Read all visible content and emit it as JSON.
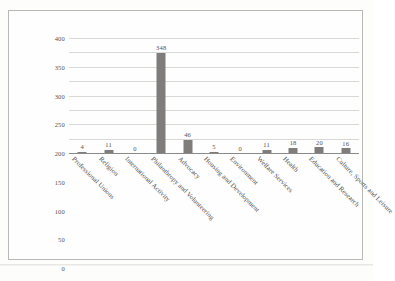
{
  "figure": {
    "caption_remnant": ""
  },
  "chart_data": {
    "type": "bar",
    "title": "",
    "xlabel": "",
    "ylabel": "",
    "ylim": [
      0,
      400
    ],
    "ytick_step": 50,
    "grid": true,
    "legend": "none",
    "bar_color": "#7e7d7b",
    "categories": [
      "Professional Unions",
      "Religion",
      "International Activity",
      "Philanthropy and Volunteering",
      "Advocacy",
      "Housing and Development",
      "Environment",
      "Welfare Services",
      "Health",
      "Education and Research",
      "Culture, Sports and Leisure"
    ],
    "values": [
      4,
      11,
      0,
      348,
      46,
      5,
      0,
      11,
      18,
      20,
      16
    ],
    "yticks": [
      "0",
      "50",
      "100",
      "150",
      "200",
      "250",
      "300",
      "350",
      "400"
    ],
    "data_labels": [
      "4",
      "11",
      "0",
      "348",
      "46",
      "5",
      "0",
      "11",
      "18",
      "20",
      "16"
    ]
  }
}
